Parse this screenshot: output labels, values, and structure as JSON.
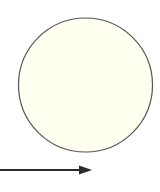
{
  "diagram": {
    "background": "#ffffff",
    "circle": {
      "cx": 85.5,
      "cy": 85,
      "r": 67,
      "fill": "#fffff0",
      "stroke": "#555555",
      "stroke_width": 1.2
    },
    "arrow": {
      "x1": 0,
      "y1": 170,
      "x2": 92,
      "y2": 170,
      "head_length": 13,
      "head_half_width": 4.5,
      "color": "#2a2a2a",
      "stroke_width": 2
    }
  }
}
